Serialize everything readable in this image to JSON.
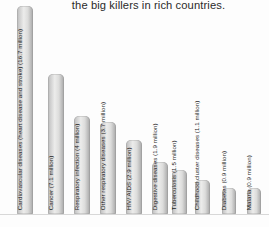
{
  "chart": {
    "title": "the big killers in rich countries.",
    "baseline_color": "#d8d8d8",
    "bar_color": "#cfcfcf"
  },
  "chart_data": {
    "type": "bar",
    "title": "the big killers in rich countries.",
    "xlabel": "",
    "ylabel": "",
    "unit": "million deaths",
    "grid": false,
    "legend": "none",
    "ylim": [
      0,
      18
    ],
    "categories": [
      "Cardiovascular diseases (heart disease and stroke)",
      "Cancer",
      "Respiratory infection",
      "Other respiratory diseases",
      "HIV/ AIDS",
      "Digestive diseases",
      "Tuberculosis",
      "Childhood cluster diseases",
      "Diabetes",
      "Malaria"
    ],
    "values": [
      16.7,
      7.1,
      4.0,
      3.7,
      2.9,
      1.9,
      1.5,
      1.1,
      0.9,
      0.9
    ],
    "tick_labels": [
      "Cardiovascular diseases (heart disease and stroke)  (16.7 million)",
      "Cancer  (7.1 million)",
      "Respiratory infection (4 million)",
      "Other respiratory diseases (3.7 million)",
      "HIV/ AIDS   (2.9 million)",
      "Digestive diseases  (1.9 million)",
      "Tuberculosis  (1.5 million)",
      "Childhood cluster diseases  (1.1 million)",
      "Diabetes (0.9 million)",
      "Malaria  (0.9 million)"
    ]
  },
  "bars": [
    {
      "label": "Cardiovascular diseases (heart disease and stroke)  (16.7 million)",
      "value": 16.7,
      "left": 17,
      "width": 16,
      "height_pct": 104
    },
    {
      "label": "Cancer  (7.1 million)",
      "value": 7.1,
      "left": 48,
      "width": 16,
      "height_pct": 70
    },
    {
      "label": "Respiratory infection (4 million)",
      "value": 4.0,
      "left": 74,
      "width": 16,
      "height_pct": 49
    },
    {
      "label": "Other respiratory diseases (3.7 million)",
      "value": 3.7,
      "left": 100,
      "width": 16,
      "height_pct": 46
    },
    {
      "label": "HIV/ AIDS   (2.9 million)",
      "value": 2.9,
      "left": 126,
      "width": 16,
      "height_pct": 37
    },
    {
      "label": "Digestive diseases  (1.9 million)",
      "value": 1.9,
      "left": 152,
      "width": 16,
      "height_pct": 26
    },
    {
      "label": "Tuberculosis  (1.5 million)",
      "value": 1.5,
      "left": 172,
      "width": 15,
      "height_pct": 22
    },
    {
      "label": "Childhood cluster diseases  (1.1 million)",
      "value": 1.1,
      "left": 195,
      "width": 15,
      "height_pct": 17
    },
    {
      "label": "Diabetes (0.9 million)",
      "value": 0.9,
      "left": 222,
      "width": 14,
      "height_pct": 13
    },
    {
      "label": "Malaria  (0.9 million)",
      "value": 0.9,
      "left": 247,
      "width": 14,
      "height_pct": 13
    }
  ]
}
